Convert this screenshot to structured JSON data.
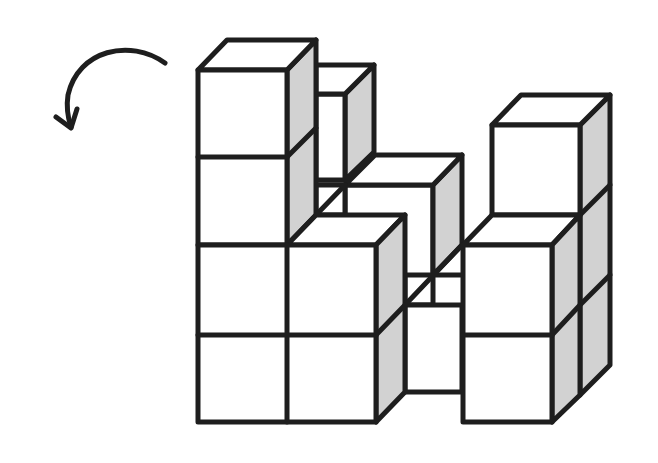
{
  "figure": {
    "colors": {
      "stroke": "#1e1e1e",
      "face": "#ffffff",
      "shade": "#d2d2d2"
    },
    "stroke_width": 5,
    "arrow": {
      "direction": "counterclockwise",
      "label": ""
    },
    "cube_groups": [
      {
        "name": "left-tower",
        "height": 4
      },
      {
        "name": "front-block",
        "height": 2
      },
      {
        "name": "back-column",
        "height": 3
      },
      {
        "name": "middle-bridge",
        "height": 1
      },
      {
        "name": "right-tower",
        "height": 3
      }
    ]
  }
}
